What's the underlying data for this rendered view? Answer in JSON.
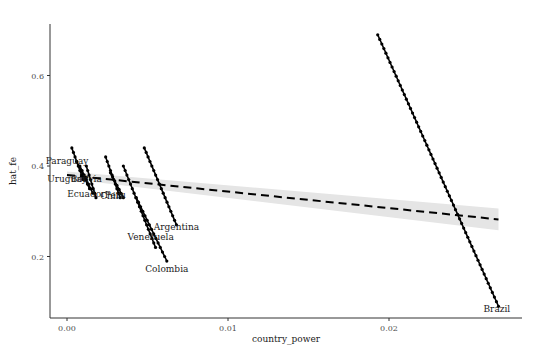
{
  "chart_data": {
    "type": "line",
    "title": "",
    "xlabel": "country_power",
    "ylabel": "hat_fe",
    "xlim": [
      -0.001,
      0.0275
    ],
    "ylim": [
      0.065,
      0.715
    ],
    "x_ticks": [
      0.0,
      0.01,
      0.02
    ],
    "x_tick_labels": [
      "0.00",
      "0.01",
      "0.02"
    ],
    "y_ticks": [
      0.2,
      0.4,
      0.6
    ],
    "y_tick_labels": [
      "0.2",
      "0.4",
      "0.6"
    ],
    "grid": false,
    "legend": "none",
    "series": [
      {
        "name": "Paraguay",
        "x": [
          0.0003,
          0.001
        ],
        "y": [
          0.44,
          0.37
        ],
        "label_pos": [
          0.0,
          0.41
        ]
      },
      {
        "name": "Uruguay",
        "x": [
          0.0006,
          0.0014
        ],
        "y": [
          0.41,
          0.35
        ],
        "label_pos": [
          0.0,
          0.372
        ]
      },
      {
        "name": "Bolivia",
        "x": [
          0.0008,
          0.0016
        ],
        "y": [
          0.4,
          0.34
        ],
        "label_pos": [
          0.0012,
          0.372
        ]
      },
      {
        "name": "Ecuador",
        "x": [
          0.0012,
          0.0018
        ],
        "y": [
          0.4,
          0.33
        ],
        "label_pos": [
          0.0012,
          0.339
        ]
      },
      {
        "name": "Chile",
        "x": [
          0.0024,
          0.0033
        ],
        "y": [
          0.42,
          0.33
        ],
        "label_pos": [
          0.0028,
          0.334
        ]
      },
      {
        "name": "Peru",
        "x": [
          0.0027,
          0.0035
        ],
        "y": [
          0.385,
          0.33
        ],
        "label_pos": [
          0.003,
          0.337
        ]
      },
      {
        "name": "Venezuela",
        "x": [
          0.0035,
          0.0055
        ],
        "y": [
          0.4,
          0.22
        ],
        "label_pos": [
          0.0052,
          0.244
        ]
      },
      {
        "name": "Colombia",
        "x": [
          0.0043,
          0.0062
        ],
        "y": [
          0.33,
          0.19
        ],
        "label_pos": [
          0.0062,
          0.173
        ]
      },
      {
        "name": "Argentina",
        "x": [
          0.0048,
          0.0068
        ],
        "y": [
          0.44,
          0.27
        ],
        "label_pos": [
          0.0068,
          0.265
        ]
      },
      {
        "name": "Brazil",
        "x": [
          0.0193,
          0.0268
        ],
        "y": [
          0.69,
          0.09
        ],
        "label_pos": [
          0.0267,
          0.083
        ]
      }
    ],
    "fit_line": {
      "style": "dashed",
      "x": [
        0.0,
        0.0268
      ],
      "y": [
        0.38,
        0.282
      ],
      "ci_band": {
        "x": [
          0.0,
          0.0268
        ],
        "lower": [
          0.372,
          0.258
        ],
        "upper": [
          0.388,
          0.306
        ],
        "color": "#e6e6e6"
      }
    }
  },
  "colors": {
    "series": "#000000",
    "axis": "#333333",
    "band": "#e5e5e5",
    "text": "#1a1a1a"
  }
}
